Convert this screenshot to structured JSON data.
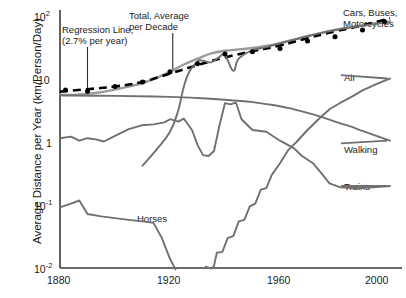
{
  "chart_data": {
    "type": "line",
    "title": "",
    "xlabel": "",
    "ylabel": "Average Distance per Year (km/Person/Day)",
    "xlim": [
      1880,
      2000
    ],
    "ylim": [
      0.01,
      100
    ],
    "yscale": "log",
    "xscale": "linear",
    "grid": false,
    "legend_position": "right-inline-labels",
    "xticks": [
      "1880",
      "1920",
      "1960",
      "2000"
    ],
    "xtick_values": [
      1880,
      1920,
      1960,
      2000
    ],
    "yticks": [
      "10",
      "10",
      "1",
      "10",
      "10"
    ],
    "ytick_values": [
      100,
      10,
      1,
      0.1,
      0.01
    ],
    "ytick_labels": [
      {
        "base": "10",
        "exp": "2"
      },
      {
        "base": "10",
        "exp": ""
      },
      {
        "base": "1",
        "exp": ""
      },
      {
        "base": "10",
        "exp": "-1"
      },
      {
        "base": "10",
        "exp": "-2"
      }
    ],
    "annotations": [
      {
        "name": "regression-line-annotation",
        "line1": "Regression Line,",
        "line2": "(2.7% per year)",
        "x": 1890,
        "leader_to_y": 7.3
      },
      {
        "name": "total-average-annotation",
        "line1": "Total, Average",
        "line2": "per Decade",
        "x": 1921,
        "leader_to_y": 24
      }
    ],
    "series": [
      {
        "name": "Total, Average per Decade",
        "label": "Total, Average per Decade",
        "style": "solid-gray",
        "color": "#8c8c8c",
        "x": [
          1880,
          1885,
          1890,
          1895,
          1900,
          1905,
          1910,
          1915,
          1920,
          1925,
          1930,
          1935,
          1940,
          1945,
          1950,
          1955,
          1960,
          1965,
          1970,
          1975,
          1980,
          1985,
          1990,
          1995,
          2000
        ],
        "y": [
          5.6,
          5.6,
          5.8,
          6.2,
          6.8,
          7.6,
          8.6,
          10.5,
          13.0,
          17.0,
          21.0,
          25.5,
          28.0,
          29.5,
          31.0,
          33.5,
          37.0,
          42.0,
          48.0,
          54.0,
          60.0,
          66.0,
          71.0,
          77.0,
          82.0
        ]
      },
      {
        "name": "Regression Line (2.7% per year)",
        "label": "Regression Line, (2.7% per year)",
        "style": "dashed-black",
        "color": "#000000",
        "x": [
          1880,
          1890,
          1900,
          1910,
          1920,
          1930,
          1940,
          1950,
          1960,
          1970,
          1980,
          1990,
          2000
        ],
        "y": [
          6.3,
          6.9,
          7.6,
          9.0,
          12.2,
          16.6,
          22.0,
          27.5,
          34.0,
          44.5,
          57.0,
          71.0,
          92.0
        ],
        "markers": true,
        "marker_x": [
          1882,
          1890,
          1900,
          1910,
          1920,
          1930,
          1940,
          1950,
          1960,
          1970,
          1980,
          1990,
          1998
        ],
        "marker_y": [
          6.7,
          6.4,
          7.6,
          9.0,
          13.0,
          17.5,
          25.0,
          27.0,
          30.5,
          40.0,
          47.0,
          60.0,
          82.0
        ]
      },
      {
        "name": "Cars, Buses, Motorcycles",
        "label": "Cars, Buses, Motorcycles",
        "style": "solid-gray",
        "color": "#707070",
        "x": [
          1910,
          1915,
          1920,
          1923,
          1925,
          1927,
          1930,
          1932,
          1935,
          1938,
          1940,
          1943,
          1945,
          1950,
          1955,
          1960,
          1965,
          1970,
          1975,
          1980,
          1985,
          1990,
          1995,
          2000
        ],
        "y": [
          0.42,
          0.75,
          1.45,
          3.2,
          7.5,
          13.0,
          19.0,
          19.5,
          18.5,
          22.5,
          24.0,
          13.5,
          21.0,
          28.5,
          32.0,
          37.0,
          42.0,
          48.0,
          54.0,
          60.0,
          65.0,
          70.0,
          75.0,
          79.0
        ]
      },
      {
        "name": "Walking",
        "label": "Walking",
        "style": "solid-gray",
        "color": "#707070",
        "x": [
          1880,
          1900,
          1920,
          1930,
          1940,
          1950,
          1955,
          1960,
          1965,
          1970,
          1975,
          1980,
          1985,
          1990,
          1995,
          2000
        ],
        "y": [
          5.5,
          5.4,
          5.2,
          5.0,
          4.7,
          4.3,
          4.0,
          3.7,
          3.3,
          2.9,
          2.5,
          2.1,
          1.8,
          1.5,
          1.25,
          1.05
        ]
      },
      {
        "name": "Trains",
        "label": "Trains",
        "style": "solid-gray",
        "color": "#707070",
        "x": [
          1880,
          1884,
          1887,
          1890,
          1893,
          1896,
          1900,
          1905,
          1910,
          1914,
          1918,
          1920,
          1923,
          1925,
          1928,
          1930,
          1932,
          1934,
          1936,
          1938,
          1940,
          1942,
          1944,
          1946,
          1950,
          1955,
          1960,
          1965,
          1968,
          1972,
          1975,
          1978,
          1982,
          1988,
          1994,
          2000
        ],
        "y": [
          1.15,
          1.22,
          1.05,
          1.15,
          1.1,
          1.02,
          1.25,
          1.6,
          1.85,
          1.9,
          2.05,
          2.3,
          2.1,
          2.35,
          1.55,
          0.9,
          0.62,
          0.6,
          0.72,
          1.85,
          4.15,
          3.95,
          4.2,
          2.3,
          1.55,
          1.45,
          1.05,
          0.8,
          0.6,
          0.46,
          0.32,
          0.22,
          0.19,
          0.185,
          0.19,
          0.2
        ]
      },
      {
        "name": "Horses",
        "label": "Horses",
        "style": "solid-gray",
        "color": "#707070",
        "x": [
          1880,
          1884,
          1887,
          1890,
          1895,
          1900,
          1905,
          1910,
          1914,
          1917,
          1920,
          1922
        ],
        "y": [
          0.092,
          0.105,
          0.118,
          0.072,
          0.066,
          0.062,
          0.058,
          0.055,
          0.052,
          0.03,
          0.014,
          0.0095
        ]
      },
      {
        "name": "Air",
        "label": "Air",
        "style": "solid-gray",
        "color": "#707070",
        "x": [
          1933,
          1935,
          1936,
          1937,
          1939,
          1941,
          1943,
          1945,
          1947,
          1949,
          1951,
          1953,
          1955,
          1957,
          1960,
          1963,
          1966,
          1970,
          1974,
          1978,
          1982,
          1986,
          1990,
          1995,
          2000
        ],
        "y": [
          0.0105,
          0.0098,
          0.0108,
          0.0175,
          0.018,
          0.03,
          0.032,
          0.055,
          0.058,
          0.095,
          0.105,
          0.175,
          0.185,
          0.3,
          0.46,
          0.75,
          1.0,
          1.55,
          2.3,
          3.3,
          4.2,
          5.2,
          6.6,
          8.3,
          10.2
        ]
      }
    ],
    "series_labels": [
      {
        "name": "cars-buses-motorcycles-label",
        "line1": "Cars, Buses,",
        "line2": "Motorcycles"
      },
      {
        "name": "air-label",
        "line1": "Air",
        "line2": ""
      },
      {
        "name": "walking-label",
        "line1": "Walking",
        "line2": ""
      },
      {
        "name": "trains-label",
        "line1": "Trains",
        "line2": ""
      },
      {
        "name": "horses-label",
        "line1": "Horses",
        "line2": ""
      }
    ]
  },
  "axis": {
    "y_title": "Average Distance per Year (km/Person/Day)",
    "x_ticks": [
      "1880",
      "1920",
      "1960",
      "2000"
    ],
    "y_ticks": [
      {
        "base": "10",
        "exp": "2"
      },
      {
        "base": "10",
        "exp": ""
      },
      {
        "base": "1",
        "exp": ""
      },
      {
        "base": "10",
        "exp": "-1"
      },
      {
        "base": "10",
        "exp": "-2"
      }
    ]
  },
  "colors": {
    "axis": "#3a3a3a",
    "curve_gray": "#707070",
    "total_gray": "#9a9a9a",
    "regression_black": "#000000",
    "text": "#1a1a1a",
    "background": "#ffffff"
  },
  "labels": {
    "regression_l1": "Regression Line,",
    "regression_l2": "(2.7% per year)",
    "total_l1": "Total, Average",
    "total_l2": "per Decade",
    "cars_l1": "Cars, Buses,",
    "cars_l2": "Motorcycles",
    "air": "Air",
    "walking": "Walking",
    "trains": "Trains",
    "horses": "Horses"
  }
}
